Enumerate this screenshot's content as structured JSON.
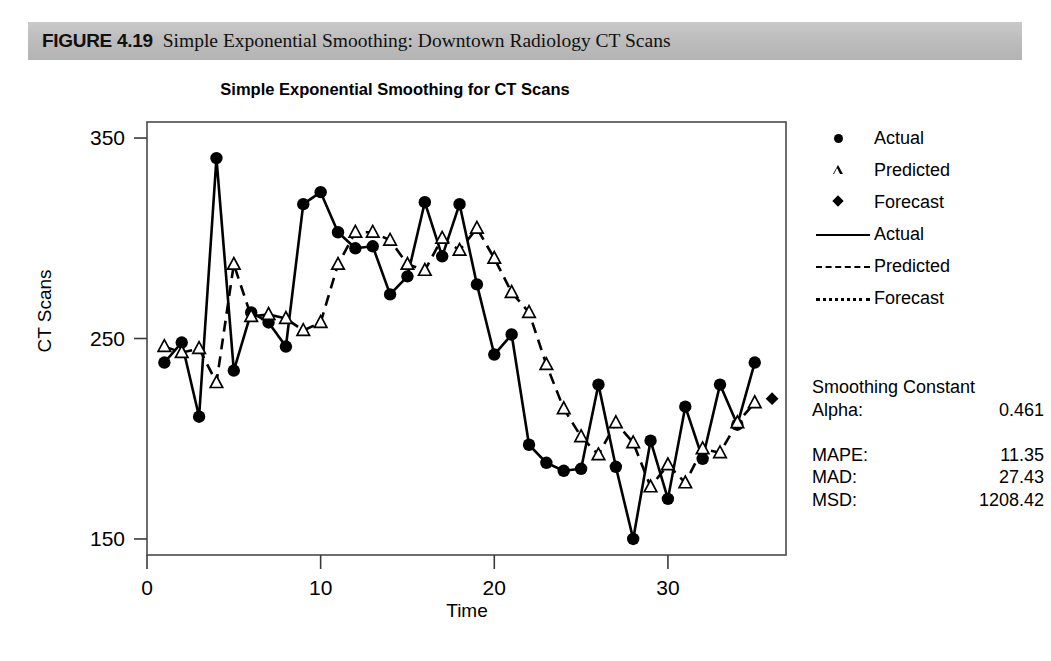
{
  "figure": {
    "label": "FIGURE 4.19",
    "caption": "Simple Exponential Smoothing: Downtown Radiology CT Scans"
  },
  "legend": {
    "items": [
      {
        "key": "circle-marker",
        "label": "Actual"
      },
      {
        "key": "triangle-marker",
        "label": "Predicted"
      },
      {
        "key": "diamond-marker",
        "label": "Forecast"
      },
      {
        "key": "solid-line",
        "label": "Actual"
      },
      {
        "key": "dashed-line",
        "label": "Predicted"
      },
      {
        "key": "dotted-line",
        "label": "Forecast"
      }
    ]
  },
  "stats": {
    "heading": "Smoothing Constant",
    "alpha_label": "Alpha:",
    "alpha_value": "0.461",
    "rows": [
      {
        "label": "MAPE:",
        "value": "11.35"
      },
      {
        "label": "MAD:",
        "value": "27.43"
      },
      {
        "label": "MSD:",
        "value": "1208.42"
      }
    ]
  },
  "chart_data": {
    "type": "line",
    "title": "Simple Exponential Smoothing for CT Scans",
    "xlabel": "Time",
    "ylabel": "CT Scans",
    "xlim": [
      0,
      36.8
    ],
    "ylim": [
      142,
      358
    ],
    "xticks": [
      0,
      10,
      20,
      30
    ],
    "yticks": [
      150,
      250,
      350
    ],
    "grid": false,
    "legend_position": "right",
    "x": [
      1,
      2,
      3,
      4,
      5,
      6,
      7,
      8,
      9,
      10,
      11,
      12,
      13,
      14,
      15,
      16,
      17,
      18,
      19,
      20,
      21,
      22,
      23,
      24,
      25,
      26,
      27,
      28,
      29,
      30,
      31,
      32,
      33,
      34,
      35
    ],
    "series": [
      {
        "name": "Actual",
        "marker": "circle",
        "line": "solid",
        "values": [
          238,
          248,
          211,
          340,
          234,
          263,
          258,
          246,
          317,
          323,
          303,
          295,
          296,
          272,
          281,
          318,
          291,
          317,
          277,
          242,
          252,
          197,
          188,
          184,
          185,
          227,
          186,
          150,
          199,
          170,
          216,
          190,
          227,
          207,
          238
        ]
      },
      {
        "name": "Predicted",
        "marker": "triangle",
        "line": "dashed",
        "values": [
          246,
          243,
          245,
          228,
          287,
          261,
          262,
          260,
          254,
          258,
          287,
          303,
          303,
          299,
          287,
          284,
          300,
          294,
          305,
          290,
          273,
          263,
          237,
          215,
          201,
          192,
          208,
          198,
          176,
          187,
          178,
          195,
          193,
          208,
          218
        ]
      },
      {
        "name": "Forecast",
        "marker": "diamond",
        "line": "dotted",
        "x": [
          36
        ],
        "values": [
          220
        ]
      }
    ]
  }
}
